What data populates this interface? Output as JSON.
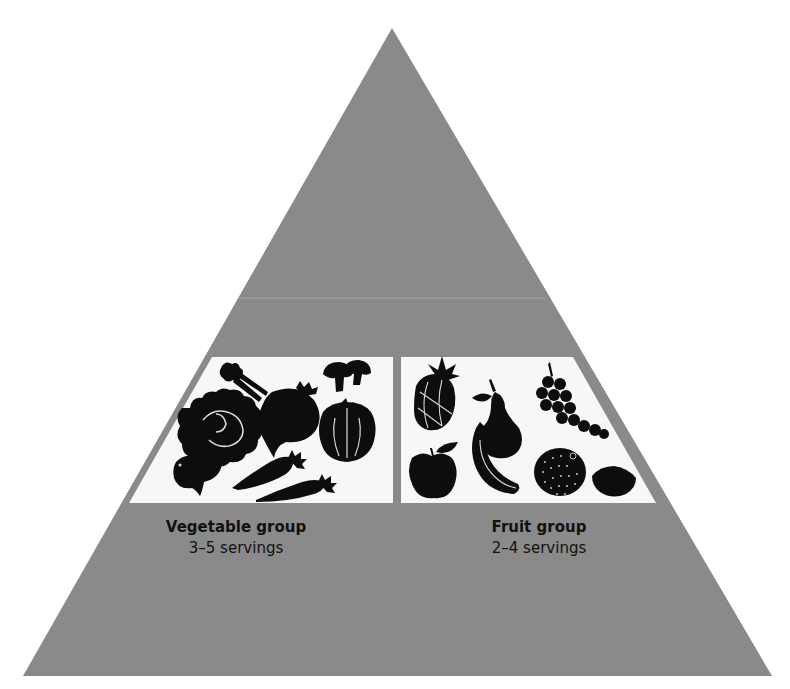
{
  "colors": {
    "pyramid_gray": "#8a8a8a",
    "divider_line": "#9a9a9a",
    "panel_white": "#f7f7f7",
    "icon_black": "#0d0d0d",
    "icon_highlight": "#d9d9d9",
    "text": "#111111"
  },
  "pyramid": {
    "apex": [
      392,
      28
    ],
    "base_left": [
      23,
      676
    ],
    "base_right": [
      772,
      676
    ],
    "tier_divider_y": 298
  },
  "panels": [
    {
      "id": "vegetable",
      "title": "Vegetable group",
      "servings": "3–5 servings",
      "icons": [
        "celery-icon",
        "beet-icon",
        "mushroom-icon",
        "mushroom-icon",
        "lettuce-icon",
        "tomato-icon",
        "radish-icon",
        "carrot-icon",
        "carrot-icon"
      ]
    },
    {
      "id": "fruit",
      "title": "Fruit group",
      "servings": "2–4 servings",
      "icons": [
        "pineapple-icon",
        "pear-icon",
        "grapes-icon",
        "apple-icon",
        "banana-icon",
        "orange-icon",
        "lemon-icon"
      ]
    }
  ]
}
